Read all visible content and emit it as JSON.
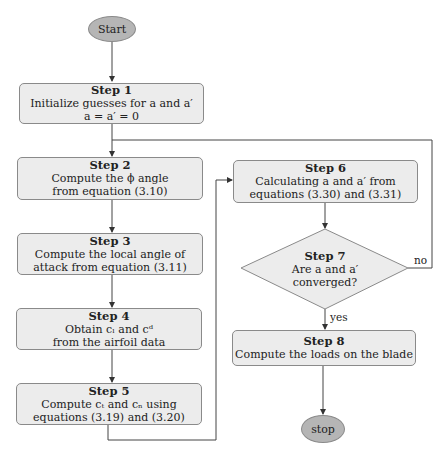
{
  "start": {
    "label": "Start"
  },
  "stop": {
    "label": "stop"
  },
  "steps": [
    {
      "title": "Step 1",
      "lines": [
        "Initialize guesses for a and a′",
        "a  =  a′  =  0"
      ]
    },
    {
      "title": "Step 2",
      "lines": [
        "Compute the ϕ angle",
        "from equation (3.10)"
      ]
    },
    {
      "title": "Step 3",
      "lines": [
        "Compute the local angle of",
        "attack from equation (3.11)"
      ]
    },
    {
      "title": "Step 4",
      "lines": [
        "Obtain cₗ and cᵈ",
        "from the airfoil data"
      ]
    },
    {
      "title": "Step 5",
      "lines": [
        "Compute cₜ and cₙ using",
        "equations (3.19) and (3.20)"
      ]
    },
    {
      "title": "Step 6",
      "lines": [
        "Calculating a and a′ from",
        "equations (3.30) and (3.31)"
      ]
    },
    {
      "title": "Step 7",
      "lines": [
        "Are a and a′",
        "converged?"
      ]
    },
    {
      "title": "Step 8",
      "lines": [
        "Compute the loads on the blade"
      ]
    }
  ],
  "edge_labels": {
    "no": "no",
    "yes": "yes"
  },
  "colors": {
    "box_fill": "#ececec",
    "terminal_fill": "#b5b5b5",
    "border": "#8a8a8a",
    "line": "#444444"
  }
}
